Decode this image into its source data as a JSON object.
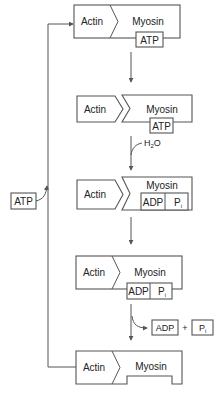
{
  "diagram": {
    "type": "cross-bridge cycle",
    "colors": {
      "line": "#555555",
      "text": "#222222",
      "background": "#ffffff"
    },
    "frames": [
      {
        "actin": "Actin",
        "myosin": "Myosin",
        "bound": [
          "ATP"
        ],
        "state": "attached"
      },
      {
        "actin": "Actin",
        "myosin": "Myosin",
        "bound": [
          "ATP"
        ],
        "state": "detached"
      },
      {
        "actin": "Actin",
        "myosin": "Myosin",
        "bound": [
          "ADP",
          "P"
        ],
        "bound_subscript": "i",
        "state": "detached"
      },
      {
        "actin": "Actin",
        "myosin": "Myosin",
        "bound": [
          "ADP",
          "P"
        ],
        "bound_subscript": "i",
        "state": "attached"
      },
      {
        "actin": "Actin",
        "myosin": "Myosin",
        "bound": [],
        "state": "attached-empty"
      }
    ],
    "steps": {
      "hydrolysis_input": "H",
      "hydrolysis_input_sub": "2",
      "hydrolysis_input_tail": "O",
      "release_products": [
        "ADP",
        "+",
        "P"
      ],
      "release_sub": "i",
      "loop_input": "ATP"
    }
  }
}
